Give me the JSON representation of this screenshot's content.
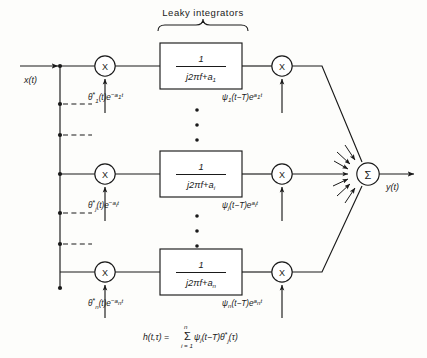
{
  "diagram": {
    "title": "Leaky integrators",
    "input_label": "x(t)",
    "output_label": "y(t)",
    "multiplier_symbol": "X",
    "summer_symbol": "Σ",
    "ellipsis_dot": "•",
    "channels": [
      {
        "id": "channel-1",
        "index_text": "1",
        "transfer_numerator": "1",
        "transfer_denominator_main": "j2πf+a",
        "transfer_denominator_sub": "1",
        "left_label_base": "θ",
        "left_label_star": "*",
        "left_label_sub": "1",
        "left_label_arg": "(t)e",
        "left_label_exp_sign": "−",
        "left_label_exp_base": "a",
        "left_label_exp_sub": "1",
        "left_label_exp_tail": "t",
        "right_label_base": "ψ",
        "right_label_sub": "1",
        "right_label_arg": "(t−T)e",
        "right_label_exp_base": "a",
        "right_label_exp_sub": "1",
        "right_label_exp_tail": "t"
      },
      {
        "id": "channel-i",
        "index_text": "i",
        "transfer_numerator": "1",
        "transfer_denominator_main": "j2πf+a",
        "transfer_denominator_sub": "i",
        "left_label_base": "θ",
        "left_label_star": "*",
        "left_label_sub": "j",
        "left_label_arg": "(t)e",
        "left_label_exp_sign": "−",
        "left_label_exp_base": "a",
        "left_label_exp_sub": "i",
        "left_label_exp_tail": "t",
        "right_label_base": "ψ",
        "right_label_sub": "j",
        "right_label_arg": "(t−T)e",
        "right_label_exp_base": "a",
        "right_label_exp_sub": "i",
        "right_label_exp_tail": "t"
      },
      {
        "id": "channel-n",
        "index_text": "n",
        "transfer_numerator": "1",
        "transfer_denominator_main": "j2πf+a",
        "transfer_denominator_sub": "n",
        "left_label_base": "θ",
        "left_label_star": "*",
        "left_label_sub": "n",
        "left_label_arg": "(t)e",
        "left_label_exp_sign": "−",
        "left_label_exp_base": "a",
        "left_label_exp_sub": "n",
        "left_label_exp_tail": "t",
        "right_label_base": "ψ",
        "right_label_sub": "n",
        "right_label_arg": "(t−T)e",
        "right_label_exp_base": "a",
        "right_label_exp_sub": "n",
        "right_label_exp_tail": "t"
      }
    ],
    "equation": {
      "lhs": "h(t,τ) =",
      "sigma": "Σ",
      "sigma_upper": "n",
      "sigma_lower": "i = 1",
      "psi": "ψ",
      "psi_sub": "j",
      "psi_arg": "(t−T)",
      "theta": "θ",
      "theta_star": "*",
      "theta_sub": "j",
      "theta_arg": "(τ)"
    },
    "colors": {
      "ink": "#1a1a1a",
      "paper": "#fdfdfb"
    }
  }
}
